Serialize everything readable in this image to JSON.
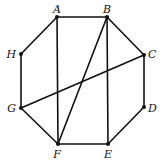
{
  "diagram": {
    "type": "octagon-graph",
    "vertices": [
      {
        "id": "A",
        "label": "A",
        "x": 57,
        "y": 17,
        "lx": 57,
        "ly": 13,
        "anchor": "middle"
      },
      {
        "id": "B",
        "label": "B",
        "x": 107,
        "y": 17,
        "lx": 107,
        "ly": 13,
        "anchor": "middle"
      },
      {
        "id": "C",
        "label": "C",
        "x": 144,
        "y": 55,
        "lx": 148,
        "ly": 58,
        "anchor": "start"
      },
      {
        "id": "D",
        "label": "D",
        "x": 144,
        "y": 107,
        "lx": 148,
        "ly": 112,
        "anchor": "start"
      },
      {
        "id": "E",
        "label": "E",
        "x": 108,
        "y": 144,
        "lx": 108,
        "ly": 158,
        "anchor": "middle"
      },
      {
        "id": "F",
        "label": "F",
        "x": 58,
        "y": 144,
        "lx": 57,
        "ly": 158,
        "anchor": "middle"
      },
      {
        "id": "G",
        "label": "G",
        "x": 21,
        "y": 108,
        "lx": 16,
        "ly": 112,
        "anchor": "end"
      },
      {
        "id": "H",
        "label": "H",
        "x": 21,
        "y": 54,
        "lx": 16,
        "ly": 58,
        "anchor": "end"
      }
    ],
    "edges": [
      [
        "A",
        "B"
      ],
      [
        "B",
        "C"
      ],
      [
        "C",
        "D"
      ],
      [
        "D",
        "E"
      ],
      [
        "E",
        "F"
      ],
      [
        "F",
        "G"
      ],
      [
        "G",
        "H"
      ],
      [
        "H",
        "A"
      ],
      [
        "A",
        "F"
      ],
      [
        "B",
        "E"
      ],
      [
        "B",
        "F"
      ],
      [
        "G",
        "C"
      ]
    ],
    "colors": {
      "stroke": "#111111",
      "background": "#ffffff"
    }
  }
}
